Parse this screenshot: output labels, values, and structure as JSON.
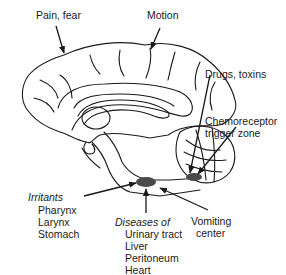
{
  "diagram": {
    "labels": {
      "pain_fear": "Pain, fear",
      "motion": "Motion",
      "drugs_toxins": "Drugs, toxins",
      "chemoreceptor_1": "Chemoreceptor",
      "chemoreceptor_2": "trigger zone",
      "irritants": "Irritants",
      "irritants_items": [
        "Pharynx",
        "Larynx",
        "Stomach"
      ],
      "diseases_of": "Diseases of",
      "diseases_items": [
        "Urinary tract",
        "Liver",
        "Peritoneum",
        "Heart"
      ],
      "vomiting_1": "Vomiting",
      "vomiting_2": "center"
    },
    "colors": {
      "line": "#1a1a1a",
      "structure_fill": "#4a4a4a",
      "background": "#ffffff"
    }
  }
}
